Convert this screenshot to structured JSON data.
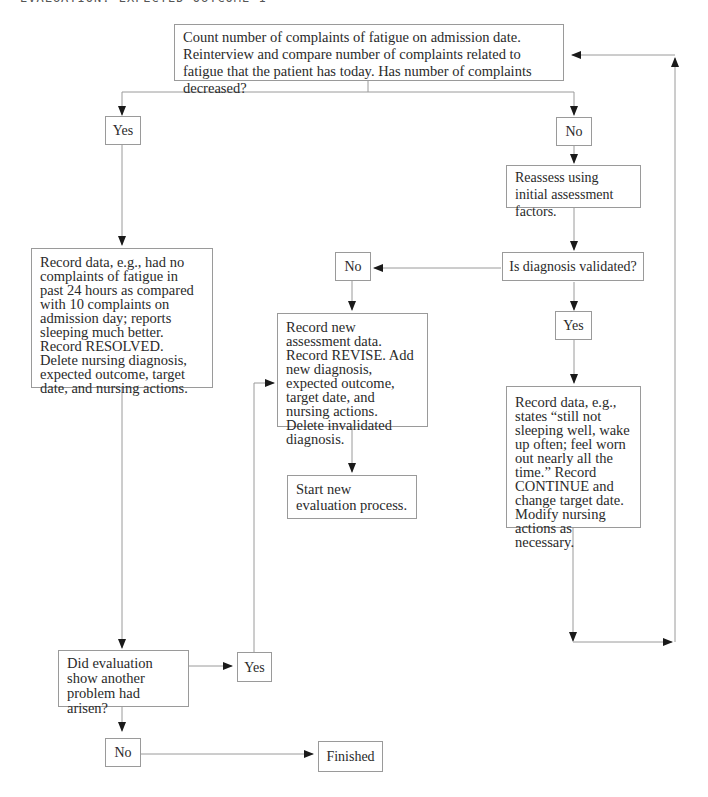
{
  "header": {
    "title": "EVALUATION: EXPECTED OUTCOME 1"
  },
  "nodes": {
    "start": {
      "text": "Count number of complaints of fatigue on admission date. Reinterview and compare number of complaints related to fatigue that the patient has today. Has number of complaints decreased?"
    },
    "yes_top": {
      "text": "Yes"
    },
    "no_top": {
      "text": "No"
    },
    "reassess": {
      "text": "Reassess using initial assessment factors."
    },
    "validated": {
      "text": "Is diagnosis validated?"
    },
    "no_validated": {
      "text": "No"
    },
    "yes_validated": {
      "text": "Yes"
    },
    "resolved": {
      "text": "Record data, e.g., had no complaints of fatigue in past 24 hours as compared with 10 complaints on admission day; reports sleeping much better. Record RESOLVED. Delete nursing diagnosis, expected outcome, target date, and nursing actions."
    },
    "revise": {
      "text": "Record new assessment data. Record REVISE. Add new diagnosis, expected outcome, target date, and nursing actions. Delete invalidated diagnosis."
    },
    "start_new": {
      "text": "Start new evaluation process."
    },
    "continue": {
      "text": "Record data, e.g., states “still not sleeping well, wake up often; feel worn out nearly all the time.” Record CONTINUE and change target date. Modify nursing actions as necessary."
    },
    "another_problem": {
      "text": "Did evaluation show another problem had arisen?"
    },
    "yes_bottom": {
      "text": "Yes"
    },
    "no_bottom": {
      "text": "No"
    },
    "finished": {
      "text": "Finished"
    }
  },
  "style": {
    "line_color": "#9a9a9a",
    "arrow_color": "#1a1a1a"
  }
}
